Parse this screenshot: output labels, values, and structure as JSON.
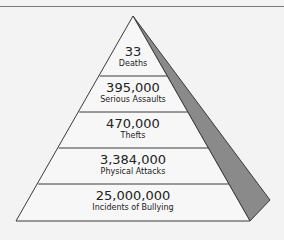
{
  "colors": {
    "background": "#f3f3f3",
    "pyramid_fill": "#f7f7f7",
    "outline": "#3a3a3a",
    "shadow": "#8a8a8a"
  },
  "pyramid": {
    "tiers": [
      {
        "value": "33",
        "label": "Deaths"
      },
      {
        "value": "395,000",
        "label": "Serious Assaults"
      },
      {
        "value": "470,000",
        "label": "Thefts"
      },
      {
        "value": "3,384,000",
        "label": "Physical Attacks"
      },
      {
        "value": "25,000,000",
        "label": "Incidents of Bullying"
      }
    ]
  }
}
